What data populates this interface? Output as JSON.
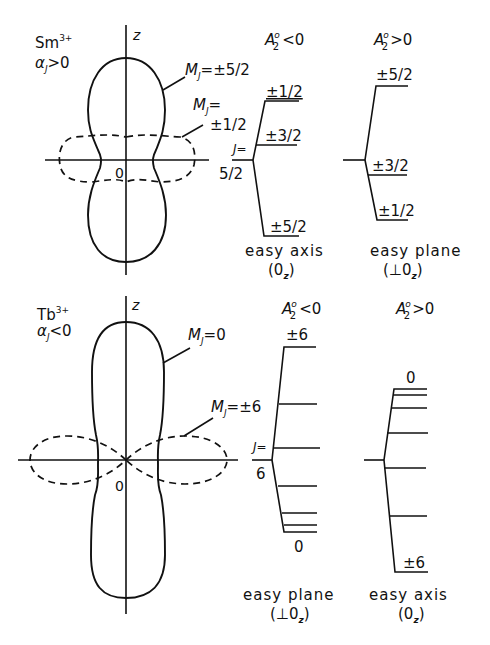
{
  "panels": [
    {
      "ion": "Sm",
      "ion_charge": "3+",
      "alpha_label": "α",
      "alpha_sub": "J",
      "alpha_rel": ">0",
      "axis_label": "z",
      "origin_label": "0",
      "solid_orbital_label": "M",
      "solid_orbital_sub": "J",
      "solid_orbital_value": "=±5/2",
      "dashed_orbital_label": "M",
      "dashed_orbital_sub": "J",
      "dashed_orbital_eq": "=",
      "dashed_orbital_value": "±1/2",
      "j_label": "J=",
      "j_value": "5/2",
      "left_scheme": {
        "title_a": "A",
        "title_sup": "o",
        "title_sub": "2",
        "title_rel": "<0",
        "levels": [
          "±1/2",
          "±3/2",
          "±5/2"
        ],
        "caption": "easy axis",
        "caption2_open": "(0",
        "caption2_sub": "z",
        "caption2_close": ")"
      },
      "right_scheme": {
        "title_a": "A",
        "title_sup": "o",
        "title_sub": "2",
        "title_rel": ">0",
        "levels": [
          "±5/2",
          "±3/2",
          "±1/2"
        ],
        "caption": "easy plane",
        "caption2_open": "(⊥0",
        "caption2_sub": "z",
        "caption2_close": ")"
      }
    },
    {
      "ion": "Tb",
      "ion_charge": "3+",
      "alpha_label": "α",
      "alpha_sub": "J",
      "alpha_rel": "<0",
      "axis_label": "z",
      "origin_label": "0",
      "solid_orbital_label": "M",
      "solid_orbital_sub": "J",
      "solid_orbital_value": "=0",
      "dashed_orbital_label": "M",
      "dashed_orbital_sub": "J",
      "dashed_orbital_value": "=±6",
      "j_label": "J=",
      "j_value": "6",
      "left_scheme": {
        "title_a": "A",
        "title_sup": "o",
        "title_sub": "2",
        "title_rel": "<0",
        "top_level": "±6",
        "bottom_level": "0",
        "caption": "easy plane",
        "caption2_open": "(⊥0",
        "caption2_sub": "z",
        "caption2_close": ")"
      },
      "right_scheme": {
        "title_a": "A",
        "title_sup": "o",
        "title_sub": "2",
        "title_rel": ">0",
        "top_level": "0",
        "bottom_level": "±6",
        "caption": "easy axis",
        "caption2_open": "(0",
        "caption2_sub": "z",
        "caption2_close": ")"
      }
    }
  ]
}
